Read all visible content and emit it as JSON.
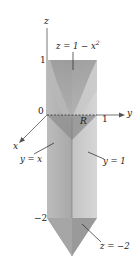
{
  "figure": {
    "axes": {
      "z_label": "z",
      "y_label": "y",
      "x_label": "x",
      "origin_label": "0"
    },
    "ticks": {
      "z_top": "1",
      "y_one": "1",
      "z_bottom": "−2"
    },
    "annotations": {
      "top_surface": "z = 1 − x",
      "top_surface_exp": "2",
      "region": "R",
      "plane_y_eq_x": "y = x",
      "plane_y_eq_1": "y = 1",
      "bottom_plane": "z = −2"
    },
    "colors": {
      "face_light": "#c9c9c9",
      "face_mid": "#b3b3b3",
      "face_dark": "#9c9c9c",
      "face_darker": "#8a8a8a",
      "axis": "#555555",
      "text": "#222222"
    }
  }
}
